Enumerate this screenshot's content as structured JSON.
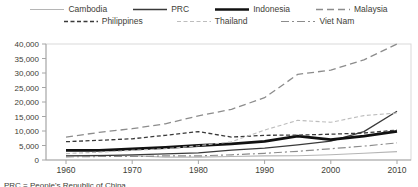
{
  "chart_data": {
    "type": "line",
    "title": "",
    "xlabel": "",
    "ylabel": "",
    "x": [
      1960,
      1965,
      1970,
      1975,
      1980,
      1985,
      1990,
      1995,
      2000,
      2005,
      2010
    ],
    "xticks": [
      1960,
      1970,
      1980,
      1990,
      2000,
      2010
    ],
    "ylim": [
      0,
      40000
    ],
    "ytick_step": 5000,
    "grid": false,
    "legend_position": "top",
    "legend_rows": [
      [
        "Cambodia",
        "PRC",
        "Indonesia",
        "Malaysia"
      ],
      [
        "Philippines",
        "Thailand",
        "Viet Nam"
      ]
    ],
    "series": [
      {
        "name": "Cambodia",
        "color": "#b5b5b5",
        "dash": "solid",
        "width": 1.1,
        "values": [
          1500,
          1600,
          1500,
          1000,
          1000,
          1200,
          1400,
          1500,
          1800,
          2300,
          2900
        ]
      },
      {
        "name": "PRC",
        "color": "#3a3a3a",
        "dash": "solid",
        "width": 1.3,
        "values": [
          1400,
          1500,
          1800,
          2100,
          2500,
          3400,
          4100,
          5200,
          6500,
          9800,
          16800
        ]
      },
      {
        "name": "Indonesia",
        "color": "#111111",
        "dash": "solid",
        "width": 2.8,
        "values": [
          3300,
          3300,
          3800,
          4300,
          5000,
          5600,
          6400,
          8200,
          7000,
          8200,
          9900
        ]
      },
      {
        "name": "Malaysia",
        "color": "#8c8c8c",
        "dash": "7,4",
        "width": 1.3,
        "values": [
          7900,
          9500,
          10800,
          12500,
          15200,
          17500,
          21500,
          29500,
          31000,
          34500,
          40000
        ]
      },
      {
        "name": "Philippines",
        "color": "#3a3a3a",
        "dash": "4,2.5",
        "width": 1.3,
        "values": [
          6300,
          6800,
          7300,
          8500,
          9800,
          7900,
          8500,
          8600,
          8900,
          9300,
          10300
        ]
      },
      {
        "name": "Thailand",
        "color": "#bdbdbd",
        "dash": "4,2.5",
        "width": 1.1,
        "values": [
          2200,
          2700,
          3300,
          3900,
          4900,
          6300,
          10300,
          13700,
          13000,
          15300,
          16200
        ]
      },
      {
        "name": "Viet Nam",
        "color": "#8c8c8c",
        "dash": "8,3,2,3",
        "width": 1.2,
        "values": [
          1100,
          1200,
          1200,
          1400,
          1400,
          1800,
          2300,
          3000,
          3900,
          4800,
          5900
        ]
      }
    ]
  },
  "footnote": "PRC = People's Republic of China.",
  "colors": {
    "background": "#ffffff",
    "text": "#3e3e36",
    "axis": "#a6a6a6",
    "frame": "#d9d9d9"
  }
}
